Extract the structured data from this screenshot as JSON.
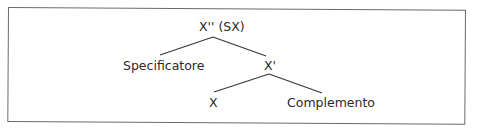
{
  "diagram": {
    "type": "x-bar syntax tree",
    "nodes": {
      "root": {
        "label": "X'' (SX)"
      },
      "specifier": {
        "label": "Specificatore"
      },
      "x_bar": {
        "label": "X'"
      },
      "head": {
        "label": "X"
      },
      "complement": {
        "label": "Complemento"
      }
    },
    "edges": [
      {
        "from": "root",
        "to": "specifier"
      },
      {
        "from": "root",
        "to": "x_bar"
      },
      {
        "from": "x_bar",
        "to": "head"
      },
      {
        "from": "x_bar",
        "to": "complement"
      }
    ],
    "colors": {
      "line": "#3a3a3a",
      "text": "#2a2a2a",
      "frame": "#6a6a6a",
      "background": "#ffffff"
    }
  }
}
